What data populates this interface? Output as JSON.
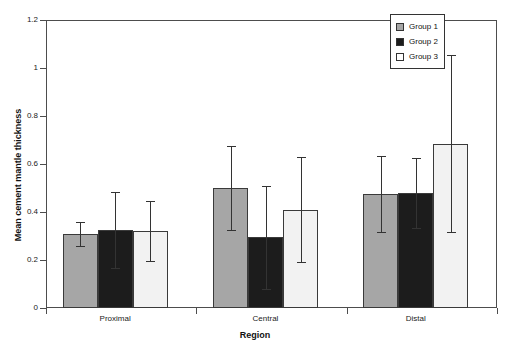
{
  "chart_data": {
    "type": "bar",
    "title": "",
    "xlabel": "Region",
    "ylabel": "Mean cement mantle thickness",
    "categories": [
      "Proximal",
      "Central",
      "Distal"
    ],
    "ylim": [
      0,
      1.2
    ],
    "yticks": [
      "0",
      "0.2",
      "0.4",
      "0.6",
      "0.8",
      "1",
      "1.2"
    ],
    "ytick_values": [
      0,
      0.2,
      0.4,
      0.6,
      0.8,
      1.0,
      1.2
    ],
    "grid": false,
    "legend_position": "top-right",
    "error_bars": "symmetric",
    "series": [
      {
        "name": "Group 1",
        "color": "#a6a6a6",
        "values": [
          0.31,
          0.5,
          0.475
        ],
        "errors": [
          0.05,
          0.175,
          0.16
        ]
      },
      {
        "name": "Group 2",
        "color": "#1c1c1c",
        "values": [
          0.325,
          0.295,
          0.48
        ],
        "errors": [
          0.16,
          0.215,
          0.145
        ]
      },
      {
        "name": "Group 3",
        "color": "#ffffff",
        "values": [
          0.32,
          0.41,
          0.685
        ],
        "errors": [
          0.125,
          0.22,
          0.37
        ]
      }
    ]
  },
  "legend": {
    "items": [
      {
        "label": "Group 1",
        "swatch": "gray-swatch"
      },
      {
        "label": "Group 2",
        "swatch": "black-swatch"
      },
      {
        "label": "Group 3",
        "swatch": "white-swatch"
      }
    ]
  },
  "axes": {
    "y_title": "Mean cement mantle thickness",
    "x_title": "Region",
    "y_labels": [
      "1.2",
      "1",
      "0.8",
      "0.6",
      "0.4",
      "0.2",
      "0"
    ],
    "x_labels": [
      "Proximal",
      "Central",
      "Distal"
    ]
  }
}
